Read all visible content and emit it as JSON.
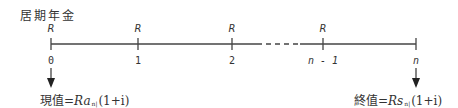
{
  "title": "居期年金",
  "timeline": {
    "payment_label": "R",
    "points": [
      {
        "index": "0",
        "has_payment": true
      },
      {
        "index": "1",
        "has_payment": true
      },
      {
        "index": "2",
        "has_payment": true
      },
      {
        "index": "n - 1",
        "has_payment": true
      },
      {
        "index": "n",
        "has_payment": false
      }
    ]
  },
  "present_value": {
    "label": "現值",
    "equals": "=",
    "coef": "R",
    "fn": "a",
    "sub": "n|",
    "factor": "(1+i)"
  },
  "future_value": {
    "label": "終值",
    "equals": "=",
    "coef": "R",
    "fn": "s",
    "sub": "n|",
    "factor": "(1+i)"
  }
}
